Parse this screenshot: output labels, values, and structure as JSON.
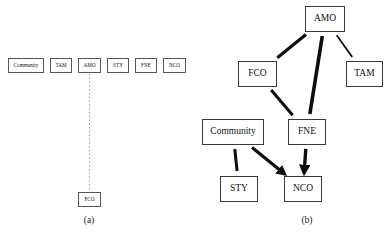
{
  "figure": {
    "panels": [
      {
        "id": "a",
        "caption": "(a)",
        "nodes": [
          {
            "name": "community",
            "label": "Community",
            "x": 8,
            "y": 58,
            "w": 36
          },
          {
            "name": "tam",
            "label": "TAM",
            "x": 50,
            "y": 58,
            "w": 22
          },
          {
            "name": "amo",
            "label": "AMO",
            "x": 78,
            "y": 58,
            "w": 23
          },
          {
            "name": "sty",
            "label": "STY",
            "x": 107,
            "y": 58,
            "w": 22
          },
          {
            "name": "fne",
            "label": "FNE",
            "x": 135,
            "y": 58,
            "w": 22
          },
          {
            "name": "nco",
            "label": "NCO",
            "x": 163,
            "y": 58,
            "w": 23
          },
          {
            "name": "fco",
            "label": "FCO",
            "x": 78,
            "y": 192,
            "w": 23
          }
        ],
        "edges": [
          {
            "name": "edge-amo-fco",
            "from": "amo",
            "to": "fco",
            "style": "dotted",
            "width": 1,
            "arrow": false
          }
        ]
      },
      {
        "id": "b",
        "caption": "(b)",
        "nodes": [
          {
            "name": "amo",
            "label": "AMO",
            "x": 110,
            "y": 6,
            "w": 40
          },
          {
            "name": "fco",
            "label": "FCO",
            "x": 43,
            "y": 61,
            "w": 39
          },
          {
            "name": "tam",
            "label": "TAM",
            "x": 151,
            "y": 61,
            "w": 37
          },
          {
            "name": "community",
            "label": "Community",
            "x": 7,
            "y": 119,
            "w": 62
          },
          {
            "name": "fne",
            "label": "FNE",
            "x": 93,
            "y": 119,
            "w": 38
          },
          {
            "name": "sty",
            "label": "STY",
            "x": 25,
            "y": 176,
            "w": 38
          },
          {
            "name": "nco",
            "label": "NCO",
            "x": 89,
            "y": 176,
            "w": 38
          }
        ],
        "edges": [
          {
            "name": "edge-amo-fco",
            "from": "amo",
            "to": "fco",
            "style": "solid",
            "width": 3.2,
            "arrow": false
          },
          {
            "name": "edge-amo-fne",
            "from": "amo",
            "to": "fne",
            "style": "solid",
            "width": 3.6,
            "arrow": false
          },
          {
            "name": "edge-amo-tam",
            "from": "amo",
            "to": "tam",
            "style": "solid",
            "width": 1.8,
            "arrow": false
          },
          {
            "name": "edge-fco-fne",
            "from": "fco",
            "to": "fne",
            "style": "solid",
            "width": 3.0,
            "arrow": false
          },
          {
            "name": "edge-community-sty",
            "from": "community",
            "to": "sty",
            "style": "solid",
            "width": 3.0,
            "arrow": false
          },
          {
            "name": "edge-community-nco",
            "from": "community",
            "to": "nco",
            "style": "solid",
            "width": 3.2,
            "arrow": true
          },
          {
            "name": "edge-fne-nco",
            "from": "fne",
            "to": "nco",
            "style": "solid",
            "width": 3.4,
            "arrow": true
          }
        ]
      }
    ],
    "colors": {
      "background": "#ffffff",
      "node_border": "#555555",
      "node_border_dark": "#3a3a3a",
      "edge": "#0d0d0d",
      "dotted_edge": "#8a8a8a",
      "text": "#111111"
    }
  }
}
